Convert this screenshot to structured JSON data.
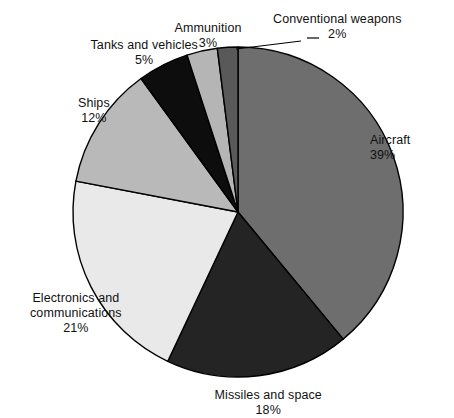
{
  "chart_data": {
    "type": "pie",
    "title": "",
    "subtitle": "",
    "xlabel": "",
    "ylabel": "",
    "legend_position": "labels-outside",
    "grid": false,
    "units": "percent",
    "start_angle_deg": 0,
    "direction": "clockwise",
    "categories": [
      "Aircraft",
      "Missiles and space",
      "Electronics and communications",
      "Ships",
      "Tanks and vehicles",
      "Ammunition",
      "Conventional weapons"
    ],
    "values": [
      39,
      18,
      21,
      12,
      5,
      3,
      2
    ],
    "slices": [
      {
        "label": "Aircraft",
        "label_lines": [
          "Aircraft"
        ],
        "value": 39,
        "percent_text": "39%",
        "color": "#6e6e6e",
        "label_x": 370,
        "label_y": 133,
        "label_align": "left"
      },
      {
        "label": "Missiles and space",
        "label_lines": [
          "Missiles and space"
        ],
        "value": 18,
        "percent_text": "18%",
        "color": "#242424",
        "label_x": 268,
        "label_y": 388,
        "label_align": "center"
      },
      {
        "label": "Electronics and communications",
        "label_lines": [
          "Electronics and",
          "communications"
        ],
        "value": 21,
        "percent_text": "21%",
        "color": "#e9e9e9",
        "label_x": 76,
        "label_y": 291,
        "label_align": "center"
      },
      {
        "label": "Ships",
        "label_lines": [
          "Ships"
        ],
        "value": 12,
        "percent_text": "12%",
        "color": "#b9b9b9",
        "label_x": 94,
        "label_y": 96,
        "label_align": "center"
      },
      {
        "label": "Tanks and vehicles",
        "label_lines": [
          "Tanks and vehicles"
        ],
        "value": 5,
        "percent_text": "5%",
        "color": "#0d0d0d",
        "label_x": 144,
        "label_y": 38,
        "label_align": "center"
      },
      {
        "label": "Ammunition",
        "label_lines": [
          "Ammunition"
        ],
        "value": 3,
        "percent_text": "3%",
        "color": "#b5b5b5",
        "label_x": 208,
        "label_y": 21,
        "label_align": "center"
      },
      {
        "label": "Conventional weapons",
        "label_lines": [
          "Conventional weapons"
        ],
        "value": 2,
        "percent_text": "2%",
        "color": "#595959",
        "label_x": 337,
        "label_y": 12,
        "label_align": "center",
        "has_leader_line": true
      }
    ],
    "geometry": {
      "center_x": 238,
      "center_y": 212,
      "radius": 165,
      "stroke_color": "#000000",
      "stroke_width": 1.4
    },
    "leader_line": {
      "name": "conventional-weapons-leader",
      "x1": 236,
      "y1": 49,
      "x2": 301,
      "y2": 41,
      "dash_x1": 307,
      "dash_y1": 38,
      "dash_x2": 319,
      "dash_y2": 38,
      "color": "#000000",
      "width": 1.2
    }
  },
  "background_color": "#ffffff"
}
